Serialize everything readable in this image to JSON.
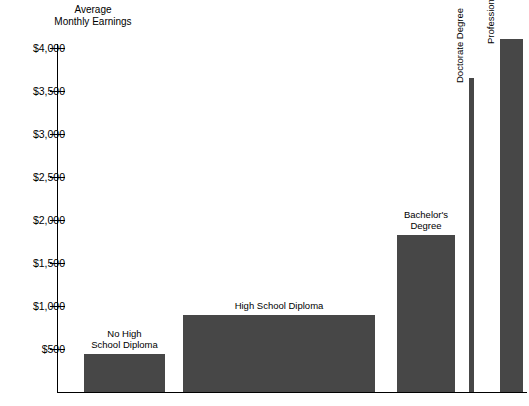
{
  "chart_data": {
    "type": "bar",
    "title": "",
    "ylabel": "Average\nMonthly Earnings",
    "xlabel": "",
    "ylim": [
      0,
      4250
    ],
    "grid": false,
    "legend": "none",
    "categories": [
      "No High\nSchool Diploma",
      "High School Diploma",
      "Bachelor's\nDegree",
      "Doctorate Degree",
      "Professional Degree"
    ],
    "values": [
      440,
      890,
      1830,
      3650,
      4100
    ],
    "ytick_labels": [
      "$500",
      "$1,000",
      "$1,500",
      "$2,000",
      "$2,500",
      "$3,000",
      "$3,500",
      "$4,000"
    ],
    "ytick_values": [
      500,
      1000,
      1500,
      2000,
      2500,
      3000,
      3500,
      4000
    ],
    "bar_color": "#474747",
    "axis_color": "#000000",
    "background_color": "#ffffff"
  },
  "axis": {
    "y_title_line1": "Average",
    "y_title_line2": "Monthly Earnings",
    "y_title": "Average\nMonthly Earnings"
  },
  "ticks": [
    {
      "label": "$4,000"
    },
    {
      "label": "$3,500"
    },
    {
      "label": "$3,000"
    },
    {
      "label": "$2,500"
    },
    {
      "label": "$2,000"
    },
    {
      "label": "$1,500"
    },
    {
      "label": "$1,000"
    },
    {
      "label": "$500"
    }
  ],
  "bars": [
    {
      "label": "No High\nSchool Diploma",
      "value": 440
    },
    {
      "label": "High School Diploma",
      "value": 890
    },
    {
      "label": "Bachelor's\nDegree",
      "value": 1830
    },
    {
      "label": "Doctorate Degree",
      "value": 3650
    },
    {
      "label": "Professional Degree",
      "value": 4100
    }
  ]
}
